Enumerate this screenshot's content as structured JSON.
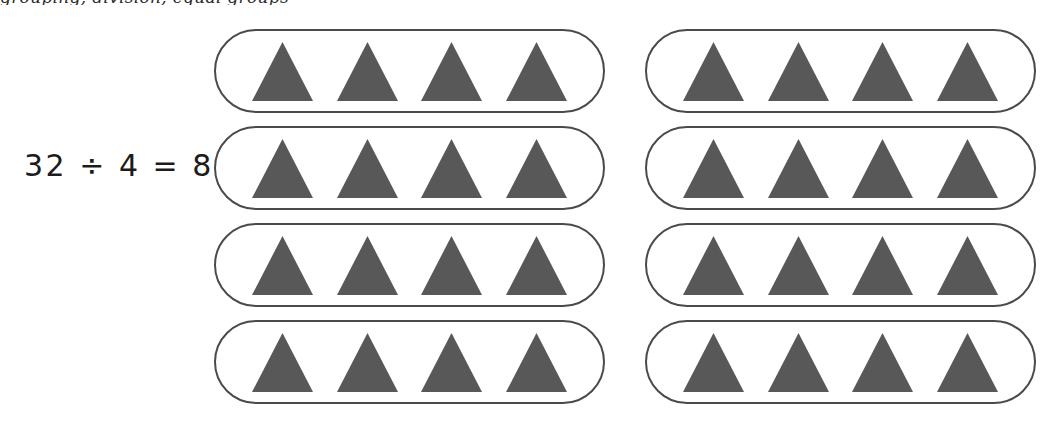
{
  "page": {
    "width": 1057,
    "height": 429,
    "background_color": "#ffffff",
    "cut_off_caption": "grouping, division, equal groups"
  },
  "equation": {
    "text": "32 ÷ 4 = 8",
    "dividend": 32,
    "divisor": 4,
    "quotient": 8,
    "operator": "÷",
    "equals": "=",
    "color": "#1c1c1c"
  },
  "colors": {
    "triangle_fill": "#585858",
    "oval_border": "#4a4a4a",
    "background": "#ffffff",
    "text": "#1c1c1c"
  },
  "chart_data": {
    "type": "diagram",
    "title": "32 ÷ 4 = 8",
    "representation": "equal-groups array model",
    "total_objects": 32,
    "objects_per_group": 4,
    "number_of_groups": 8,
    "object_shape": "triangle",
    "object_color": "#585858",
    "group_shape": "rounded-oval",
    "columns": 2,
    "rows": 4,
    "groups": [
      {
        "column": 0,
        "row": 0,
        "count": 4
      },
      {
        "column": 0,
        "row": 1,
        "count": 4
      },
      {
        "column": 0,
        "row": 2,
        "count": 4
      },
      {
        "column": 0,
        "row": 3,
        "count": 4
      },
      {
        "column": 1,
        "row": 0,
        "count": 4
      },
      {
        "column": 1,
        "row": 1,
        "count": 4
      },
      {
        "column": 1,
        "row": 2,
        "count": 4
      },
      {
        "column": 1,
        "row": 3,
        "count": 4
      }
    ]
  },
  "grid": {
    "columns": [
      {
        "index": 0,
        "groups": [
          {
            "id": "group-1",
            "triangles": 4
          },
          {
            "id": "group-2",
            "triangles": 4
          },
          {
            "id": "group-3",
            "triangles": 4
          },
          {
            "id": "group-4",
            "triangles": 4
          }
        ]
      },
      {
        "index": 1,
        "groups": [
          {
            "id": "group-5",
            "triangles": 4
          },
          {
            "id": "group-6",
            "triangles": 4
          },
          {
            "id": "group-7",
            "triangles": 4
          },
          {
            "id": "group-8",
            "triangles": 4
          }
        ]
      }
    ]
  }
}
